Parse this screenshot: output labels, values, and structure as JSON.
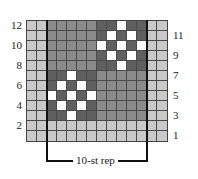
{
  "chart": {
    "columns": 14,
    "rows": 12,
    "colors": {
      "L": "#c9c9c9",
      "M": "#8b8b8b",
      "D": "#5f5f5f",
      "W": "#ffffff"
    },
    "legend_keys": {
      "L": "light-gray",
      "M": "medium-gray",
      "D": "dark-gray",
      "W": "white"
    },
    "grid_rows_top_to_bottom": [
      "LLMMMMMDDWDDLL",
      "LLMMMMMDWDWDLL",
      "LLMMMMMWDWDWLL",
      "LLMMMMMDWDWDLL",
      "LLMMMMMDDWDDLL",
      "LLDDWDDMMMMMLL",
      "LLDWDWDMMMMMLL",
      "LLWDWDWMMMMMLL",
      "LLDWDWDMMMMMLL",
      "LLDDWDDMMMMMLL",
      "LLLLLLLLLLLLLL",
      "LLLLLLLLLLLLLL"
    ],
    "left_row_labels": [
      "12",
      "10",
      "8",
      "6",
      "4",
      "2"
    ],
    "right_row_labels": [
      "11",
      "9",
      "7",
      "5",
      "3",
      "1"
    ],
    "repeat_label": "10-st rep"
  }
}
